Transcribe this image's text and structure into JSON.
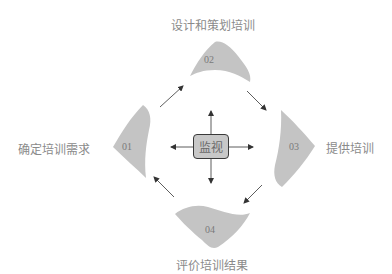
{
  "diagram": {
    "type": "training-cycle",
    "center": {
      "label": "监视"
    },
    "steps": [
      {
        "number": "01",
        "label": "确定培训需求"
      },
      {
        "number": "02",
        "label": "设计和策划培训"
      },
      {
        "number": "03",
        "label": "提供培训"
      },
      {
        "number": "04",
        "label": "评价培训结果"
      }
    ],
    "colors": {
      "shape_fill": "#c4c4c4",
      "center_fill": "#c8c8c8",
      "center_border": "#3a3a3a",
      "arrow": "#333333",
      "text": "#8a8a8a"
    }
  }
}
